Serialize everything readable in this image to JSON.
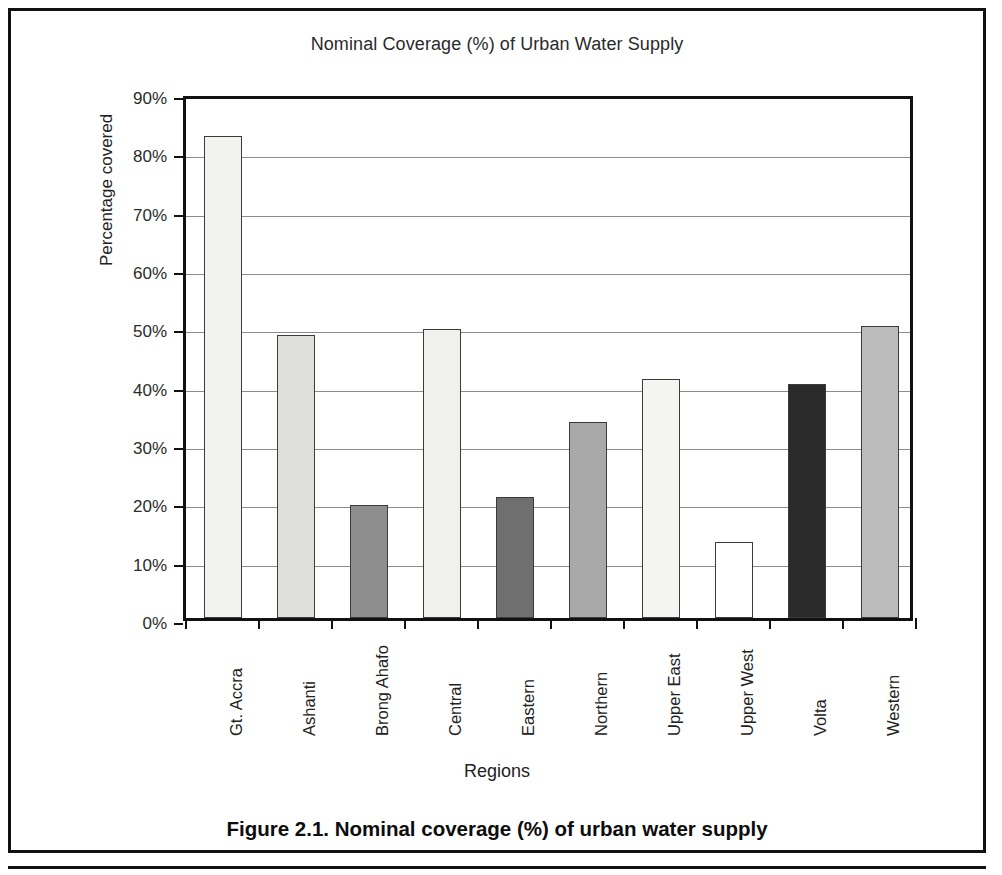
{
  "figure": {
    "caption": "Figure 2.1. Nominal coverage (%) of urban water supply"
  },
  "chart_data": {
    "type": "bar",
    "title": "Nominal Coverage (%) of Urban Water Supply",
    "xlabel": "Regions",
    "ylabel": "Percentage covered",
    "ylim": [
      0,
      90
    ],
    "ytick_labels": [
      "0%",
      "10%",
      "20%",
      "30%",
      "40%",
      "50%",
      "60%",
      "70%",
      "80%",
      "90%"
    ],
    "ytick_values": [
      0,
      10,
      20,
      30,
      40,
      50,
      60,
      70,
      80,
      90
    ],
    "grid": "horizontal",
    "legend": "none",
    "unit": "%",
    "categories": [
      "Gt. Accra",
      "Ashanti",
      "Brong Ahafo",
      "Central",
      "Eastern",
      "Northern",
      "Upper East",
      "Upper West",
      "Volta",
      "Western"
    ],
    "values": [
      82.6,
      48.5,
      19.3,
      49.5,
      20.8,
      33.6,
      41.0,
      13.1,
      40.2,
      50.1
    ],
    "bar_colors": [
      "#f2f2ef",
      "#dededa",
      "#8e8e8e",
      "#f0f0ec",
      "#6f6f6f",
      "#a9a9a9",
      "#f4f4f1",
      "#ffffff",
      "#2a2a2a",
      "#bcbcbc"
    ]
  }
}
